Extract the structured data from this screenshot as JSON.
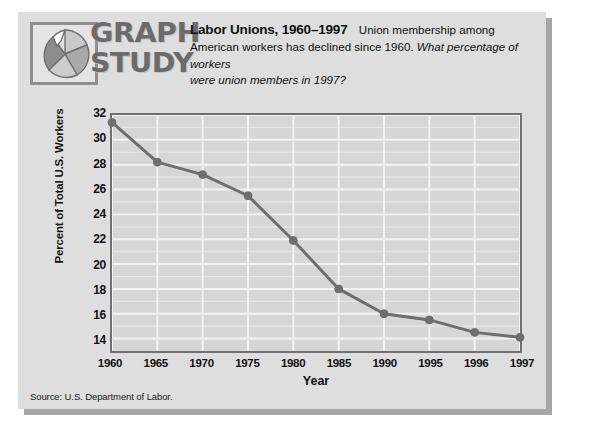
{
  "card": {
    "logo": {
      "line1": "GRAPH",
      "line2": "STUDY",
      "icon_name": "pie-chart-icon"
    },
    "heading": {
      "title": "Labor Unions, 1960–1997",
      "subtitle_part1": "Union membership among",
      "subtitle_line2_normal": "American workers has declined since 1960. ",
      "subtitle_line2_italic": "What percentage of workers",
      "subtitle_line3_italic": "were union members in 1997?"
    },
    "source_note": "Source: U.S. Department of Labor."
  },
  "chart_data": {
    "type": "line",
    "title": "Labor Unions, 1960–1997",
    "xlabel": "Year",
    "ylabel": "Percent of Total U.S. Workers",
    "categories": [
      "1960",
      "1965",
      "1970",
      "1975",
      "1980",
      "1985",
      "1990",
      "1995",
      "1996",
      "1997"
    ],
    "values": [
      31.4,
      28.2,
      27.2,
      25.5,
      21.9,
      18.0,
      16.0,
      15.5,
      14.5,
      14.1
    ],
    "ylim": [
      13,
      32
    ],
    "yticks": [
      14,
      16,
      18,
      20,
      22,
      24,
      26,
      28,
      30,
      32
    ],
    "ytick_labels": [
      "14",
      "16",
      "18",
      "20",
      "22",
      "24",
      "26",
      "28",
      "30",
      "32"
    ],
    "minor_yticks": [
      15,
      17,
      19,
      21,
      23,
      25,
      27,
      29,
      31
    ],
    "grid": true,
    "legend": null,
    "series_color": "#6e6e6e",
    "plot_background": "#d6d6d6",
    "gridline_color": "#f2f2f2",
    "marker": "circle"
  }
}
